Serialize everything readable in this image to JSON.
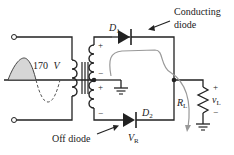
{
  "diagram": {
    "type": "full-wave center-tapped rectifier",
    "source_amplitude": "170 V",
    "labels": {
      "source_voltage_value": "170",
      "source_voltage_unit": "V",
      "source_voltage_sub": "I",
      "d1": "D",
      "d1_sub": "1",
      "d2": "D",
      "d2_sub": "2",
      "rl": "R",
      "rl_sub": "L",
      "vl": "v",
      "vl_sub": "L",
      "vl_plus": "+",
      "vl_minus": "−",
      "vr": "V",
      "vr_sub": "R",
      "conducting_line1": "Conducting",
      "conducting_line2": "diode",
      "off_diode": "Off diode",
      "upper_plus": "+",
      "upper_minus": "−",
      "lower_plus": "+",
      "lower_minus": "−"
    },
    "colors": {
      "wire": "#222222",
      "current_path": "#999999",
      "waveform_fill": "#d0d0d0"
    }
  }
}
